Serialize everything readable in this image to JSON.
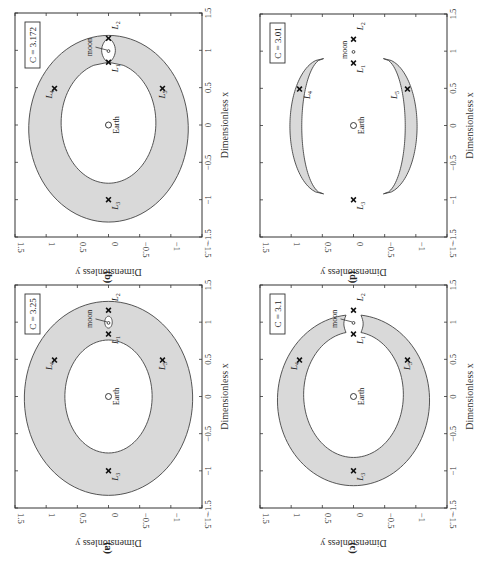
{
  "figure": {
    "rotation": "90° clockwise (x-axis runs bottom-to-top along the right edge, y-axis runs right-to-left along the bottom edge)"
  },
  "chart_data": [
    {
      "id": "b",
      "panel_label": "(b)",
      "type": "area",
      "title": "C = 3.172",
      "jacobi_constant": 3.172,
      "xlabel": "Dimensionless x",
      "ylabel": "Dimensionless y",
      "xlim": [
        -1.5,
        1.5
      ],
      "ylim": [
        -1.5,
        1.5
      ],
      "xticks": [
        "-1.5",
        "-1",
        "-0.5",
        "0",
        "0.5",
        "1",
        "1.5"
      ],
      "yticks": [
        "1.5",
        "1",
        "0.5",
        "0",
        "-0.5",
        "-1",
        "-1.5"
      ],
      "shape": "ring-with-neck",
      "forbidden_region": {
        "outer": {
          "x_min": -1.3,
          "x_max": 1.2,
          "y_half": 1.28
        },
        "inner": {
          "x_min": -0.78,
          "x_max": 0.84,
          "y_half": 0.76
        },
        "neck": {
          "x_from": 0.84,
          "x_to": 1.16,
          "y_half": 0.11
        }
      },
      "points": [
        {
          "name": "Earth",
          "x": 0,
          "y": 0,
          "marker": "circle"
        },
        {
          "name": "moon",
          "x": 0.99,
          "y": 0,
          "marker": "small-circle"
        },
        {
          "name": "L1",
          "x": 0.84,
          "y": 0,
          "marker": "x"
        },
        {
          "name": "L2",
          "x": 1.16,
          "y": 0,
          "marker": "x"
        },
        {
          "name": "L3",
          "x": -1.0,
          "y": 0,
          "marker": "x"
        },
        {
          "name": "L4",
          "x": 0.49,
          "y": 0.866,
          "marker": "x"
        },
        {
          "name": "L5",
          "x": 0.49,
          "y": -0.866,
          "marker": "x"
        }
      ],
      "annotations": [
        "C = 3.172",
        "moon",
        "Earth",
        "L1",
        "L2",
        "L3",
        "L4",
        "L5"
      ]
    },
    {
      "id": "d",
      "panel_label": "(d)",
      "type": "area",
      "title": "C = 3.01",
      "jacobi_constant": 3.01,
      "xlabel": "Dimensionless x",
      "ylabel": "Dimensionless y",
      "xlim": [
        -1.5,
        1.5
      ],
      "ylim": [
        -1.5,
        1.5
      ],
      "xticks": [
        "-1.5",
        "-1",
        "-0.5",
        "0",
        "0.5",
        "1",
        "1.5"
      ],
      "yticks": [
        "1.5",
        "1",
        "0.5",
        "0",
        "-0.5",
        "-1",
        "-1.5"
      ],
      "shape": "two-crescents",
      "forbidden_region": {
        "crescent_x_range": [
          -0.92,
          0.9
        ],
        "outer_y_peak": 1.02,
        "inner_y_peak": 0.83,
        "tip_y": 0.48
      },
      "points": [
        {
          "name": "Earth",
          "x": 0,
          "y": 0,
          "marker": "circle"
        },
        {
          "name": "moon",
          "x": 0.99,
          "y": 0,
          "marker": "small-circle"
        },
        {
          "name": "L1",
          "x": 0.84,
          "y": 0,
          "marker": "x"
        },
        {
          "name": "L2",
          "x": 1.16,
          "y": 0,
          "marker": "x"
        },
        {
          "name": "L3",
          "x": -1.0,
          "y": 0,
          "marker": "x"
        },
        {
          "name": "L4",
          "x": 0.49,
          "y": 0.866,
          "marker": "x"
        },
        {
          "name": "L5",
          "x": 0.49,
          "y": -0.866,
          "marker": "x"
        }
      ],
      "annotations": [
        "C = 3.01",
        "moon",
        "Earth",
        "L1",
        "L2",
        "L3",
        "L4",
        "L5"
      ]
    },
    {
      "id": "a",
      "panel_label": "(a)",
      "type": "area",
      "title": "C = 3.25",
      "jacobi_constant": 3.25,
      "xlabel": "Dimensionless x",
      "ylabel": "Dimensionless y",
      "xlim": [
        -1.5,
        1.5
      ],
      "ylim": [
        -1.5,
        1.5
      ],
      "xticks": [
        "-1.5",
        "-1",
        "-0.5",
        "0",
        "0.5",
        "1",
        "1.5"
      ],
      "yticks": [
        "1.5",
        "1",
        "0.5",
        "0",
        "-0.5",
        "-1",
        "-1.5"
      ],
      "shape": "ring-with-moon-island",
      "forbidden_region": {
        "outer": {
          "x_min": -1.33,
          "x_max": 1.28,
          "y_half": 1.35
        },
        "inner": {
          "x_min": -0.76,
          "x_max": 0.76,
          "y_half": 0.7
        },
        "moon_hole": {
          "x_center": 1.0,
          "x_half": 0.08,
          "y_half": 0.06
        }
      },
      "points": [
        {
          "name": "Earth",
          "x": 0,
          "y": 0,
          "marker": "circle"
        },
        {
          "name": "moon",
          "x": 0.99,
          "y": 0,
          "marker": "small-circle"
        },
        {
          "name": "L1",
          "x": 0.84,
          "y": 0,
          "marker": "x"
        },
        {
          "name": "L2",
          "x": 1.16,
          "y": 0,
          "marker": "x"
        },
        {
          "name": "L3",
          "x": -1.0,
          "y": 0,
          "marker": "x"
        },
        {
          "name": "L4",
          "x": 0.49,
          "y": 0.866,
          "marker": "x"
        },
        {
          "name": "L5",
          "x": 0.49,
          "y": -0.866,
          "marker": "x"
        }
      ],
      "annotations": [
        "C = 3.25",
        "moon",
        "Earth",
        "L1",
        "L2",
        "L3",
        "L4",
        "L5"
      ]
    },
    {
      "id": "c",
      "panel_label": "(c)",
      "type": "area",
      "title": "C = 3.1",
      "jacobi_constant": 3.1,
      "xlabel": "Dimensionless x",
      "ylabel": "Dimensionless y",
      "xlim": [
        -1.5,
        1.5
      ],
      "ylim": [
        -1.5,
        1.5
      ],
      "xticks": [
        "-1.5",
        "-1",
        "-0.5",
        "0",
        "0.5",
        "1",
        "1.5"
      ],
      "yticks": [
        "1.5",
        "1",
        "0.5",
        "0",
        "-0.5",
        "-1",
        "-1.5"
      ],
      "shape": "horseshoe",
      "forbidden_region": {
        "outer": {
          "x_min": -1.2,
          "x_max": 1.1,
          "y_half": 1.22
        },
        "inner": {
          "x_min": -0.82,
          "x_max": 0.87,
          "y_half": 0.8
        },
        "gap_y_half": 0.12
      },
      "points": [
        {
          "name": "Earth",
          "x": 0,
          "y": 0,
          "marker": "circle"
        },
        {
          "name": "moon",
          "x": 0.99,
          "y": 0,
          "marker": "small-circle"
        },
        {
          "name": "L1",
          "x": 0.84,
          "y": 0,
          "marker": "x"
        },
        {
          "name": "L2",
          "x": 1.16,
          "y": 0,
          "marker": "x"
        },
        {
          "name": "L3",
          "x": -1.0,
          "y": 0,
          "marker": "x"
        },
        {
          "name": "L4",
          "x": 0.49,
          "y": 0.866,
          "marker": "x"
        },
        {
          "name": "L5",
          "x": 0.49,
          "y": -0.866,
          "marker": "x"
        }
      ],
      "annotations": [
        "C = 3.1",
        "moon",
        "Earth",
        "L1",
        "L2",
        "L3",
        "L4",
        "L5"
      ]
    }
  ],
  "labels": {
    "earth": "Earth",
    "moon": "moon",
    "L_prefix": "L",
    "L1_sub": "1",
    "L2_sub": "2",
    "L3_sub": "3",
    "L4_sub": "4",
    "L5_sub": "5"
  }
}
